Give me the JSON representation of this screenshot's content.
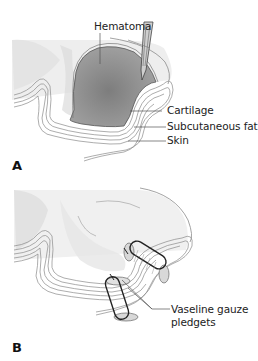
{
  "figure": {
    "panels": [
      {
        "id": "A",
        "letter": "A",
        "labels": {
          "hematoma": "Hematoma",
          "cartilage": "Cartilage",
          "subcutaneous_fat": "Subcutaneous fat",
          "skin": "Skin"
        }
      },
      {
        "id": "B",
        "letter": "B",
        "labels": {
          "pledgets_line1": "Vaseline gauze",
          "pledgets_line2": "pledgets"
        }
      }
    ],
    "colors": {
      "hematoma_fill": "#8a8a8a",
      "tissue_outline": "#777777",
      "label_text": "#222222",
      "leader_line": "#555555",
      "suture": "#222222"
    }
  }
}
